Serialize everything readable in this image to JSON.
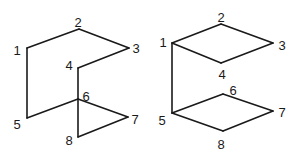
{
  "figures": [
    {
      "id": "left",
      "vertices": [
        {
          "label": "1",
          "x": 27,
          "y": 48,
          "lx": 17,
          "ly": 50
        },
        {
          "label": "2",
          "x": 79,
          "y": 29,
          "lx": 78,
          "ly": 22
        },
        {
          "label": "3",
          "x": 129,
          "y": 48,
          "lx": 136,
          "ly": 48
        },
        {
          "label": "4",
          "x": 78,
          "y": 68,
          "lx": 69,
          "ly": 65
        },
        {
          "label": "5",
          "x": 27,
          "y": 118,
          "lx": 17,
          "ly": 124
        },
        {
          "label": "6",
          "x": 78,
          "y": 99,
          "lx": 86,
          "ly": 96
        },
        {
          "label": "7",
          "x": 128,
          "y": 117,
          "lx": 135,
          "ly": 119
        },
        {
          "label": "8",
          "x": 78,
          "y": 137,
          "lx": 69,
          "ly": 140
        }
      ],
      "edges": [
        [
          "1",
          "2"
        ],
        [
          "2",
          "3"
        ],
        [
          "3",
          "4"
        ],
        [
          "4",
          "6"
        ],
        [
          "6",
          "8"
        ],
        [
          "8",
          "7"
        ],
        [
          "7",
          "6"
        ],
        [
          "6",
          "5"
        ],
        [
          "5",
          "1"
        ]
      ]
    },
    {
      "id": "right",
      "vertices": [
        {
          "label": "1",
          "x": 172,
          "y": 43,
          "lx": 163,
          "ly": 42
        },
        {
          "label": "2",
          "x": 221,
          "y": 24,
          "lx": 221,
          "ly": 17
        },
        {
          "label": "3",
          "x": 273,
          "y": 43,
          "lx": 282,
          "ly": 45
        },
        {
          "label": "4",
          "x": 221,
          "y": 63,
          "lx": 222,
          "ly": 74
        },
        {
          "label": "5",
          "x": 172,
          "y": 113,
          "lx": 162,
          "ly": 120
        },
        {
          "label": "6",
          "x": 223,
          "y": 94,
          "lx": 233,
          "ly": 90
        },
        {
          "label": "7",
          "x": 273,
          "y": 111,
          "lx": 282,
          "ly": 112
        },
        {
          "label": "8",
          "x": 223,
          "y": 131,
          "lx": 221,
          "ly": 144
        }
      ],
      "edges": [
        [
          "1",
          "2"
        ],
        [
          "2",
          "3"
        ],
        [
          "3",
          "4"
        ],
        [
          "4",
          "1"
        ],
        [
          "1",
          "5"
        ],
        [
          "5",
          "6"
        ],
        [
          "6",
          "7"
        ],
        [
          "7",
          "8"
        ],
        [
          "8",
          "5"
        ]
      ]
    }
  ]
}
